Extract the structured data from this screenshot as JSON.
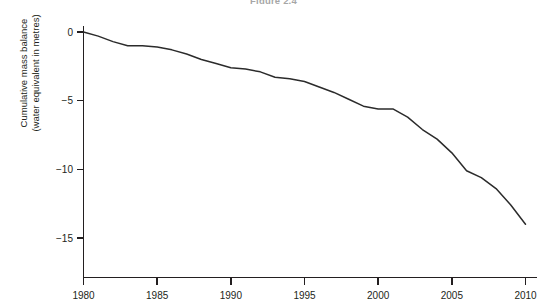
{
  "figure": {
    "title": "Figure 2.4"
  },
  "chart_data": {
    "type": "line",
    "title": "Figure 2.4",
    "xlabel": "",
    "ylabel": "Cumulative mass balance (water equivalent in metres)",
    "ylabel_line1": "Cumulative mass balance",
    "ylabel_line2": "(water equivalent in metres)",
    "xlim": [
      1980,
      2010
    ],
    "ylim": [
      -15,
      0
    ],
    "grid": false,
    "legend": null,
    "x_ticks": [
      1980,
      1985,
      1990,
      1995,
      2000,
      2005,
      2010
    ],
    "x_tick_labels": [
      "1980",
      "1985",
      "1990",
      "1995",
      "2000",
      "2005",
      "2010"
    ],
    "y_ticks": [
      0,
      -5,
      -10,
      -15
    ],
    "y_tick_labels": [
      "0",
      "−5",
      "−10",
      "−15"
    ],
    "line_color": "#2b2b2b",
    "series": [
      {
        "name": "Cumulative mass balance",
        "x": [
          1980,
          1981,
          1982,
          1983,
          1984,
          1985,
          1986,
          1987,
          1988,
          1989,
          1990,
          1991,
          1992,
          1993,
          1994,
          1995,
          1996,
          1997,
          1998,
          1999,
          2000,
          2001,
          2002,
          2003,
          2004,
          2005,
          2006,
          2007,
          2008,
          2009,
          2010
        ],
        "values": [
          0.0,
          -0.3,
          -0.7,
          -1.0,
          -1.0,
          -1.1,
          -1.3,
          -1.6,
          -2.0,
          -2.3,
          -2.6,
          -2.7,
          -2.9,
          -3.3,
          -3.4,
          -3.6,
          -4.0,
          -4.4,
          -4.9,
          -5.4,
          -5.6,
          -5.6,
          -6.2,
          -7.1,
          -7.8,
          -8.8,
          -10.1,
          -10.6,
          -11.4,
          -12.6,
          -14.0
        ]
      }
    ]
  },
  "axes": {
    "y_axis_label": "y-axis",
    "x_axis_label": "x-axis"
  }
}
